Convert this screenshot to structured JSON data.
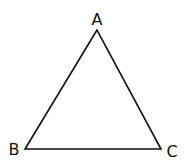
{
  "diagram": {
    "type": "triangle",
    "stroke_color": "#111111",
    "background": "#ffffff",
    "vertices": [
      {
        "label": "A",
        "x": 97,
        "y": 30,
        "label_x": 97,
        "label_y": 25
      },
      {
        "label": "B",
        "x": 25,
        "y": 149,
        "label_x": 14,
        "label_y": 155
      },
      {
        "label": "C",
        "x": 161,
        "y": 149,
        "label_x": 172,
        "label_y": 157
      }
    ]
  }
}
